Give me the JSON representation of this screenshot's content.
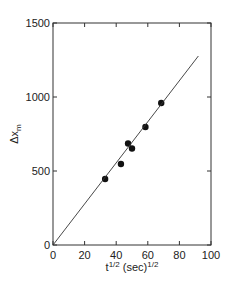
{
  "chart_data": {
    "type": "scatter",
    "title": "",
    "xlabel": "t^1/2 (sec)^1/2",
    "ylabel": "Δx_m",
    "xlim": [
      0,
      100
    ],
    "ylim": [
      0,
      1500
    ],
    "x_ticks": [
      0,
      20,
      40,
      60,
      80,
      100
    ],
    "y_ticks": [
      0,
      500,
      1000,
      1500
    ],
    "grid": false,
    "legend": null,
    "series": [
      {
        "name": "data",
        "marker": "filled-circle",
        "x": [
          33,
          43,
          47.5,
          50,
          58.5,
          68.5
        ],
        "y": [
          446,
          547,
          686,
          652,
          797,
          959
        ]
      },
      {
        "name": "fit",
        "style": "line",
        "x": [
          0,
          92
        ],
        "y": [
          0,
          1277
        ]
      }
    ]
  },
  "axes": {
    "x_label_main": "t",
    "x_label_sup1": "1/2",
    "x_label_mid": " (sec)",
    "x_label_sup2": "1/2",
    "y_label_main": "Δx",
    "y_label_sub": "m"
  }
}
